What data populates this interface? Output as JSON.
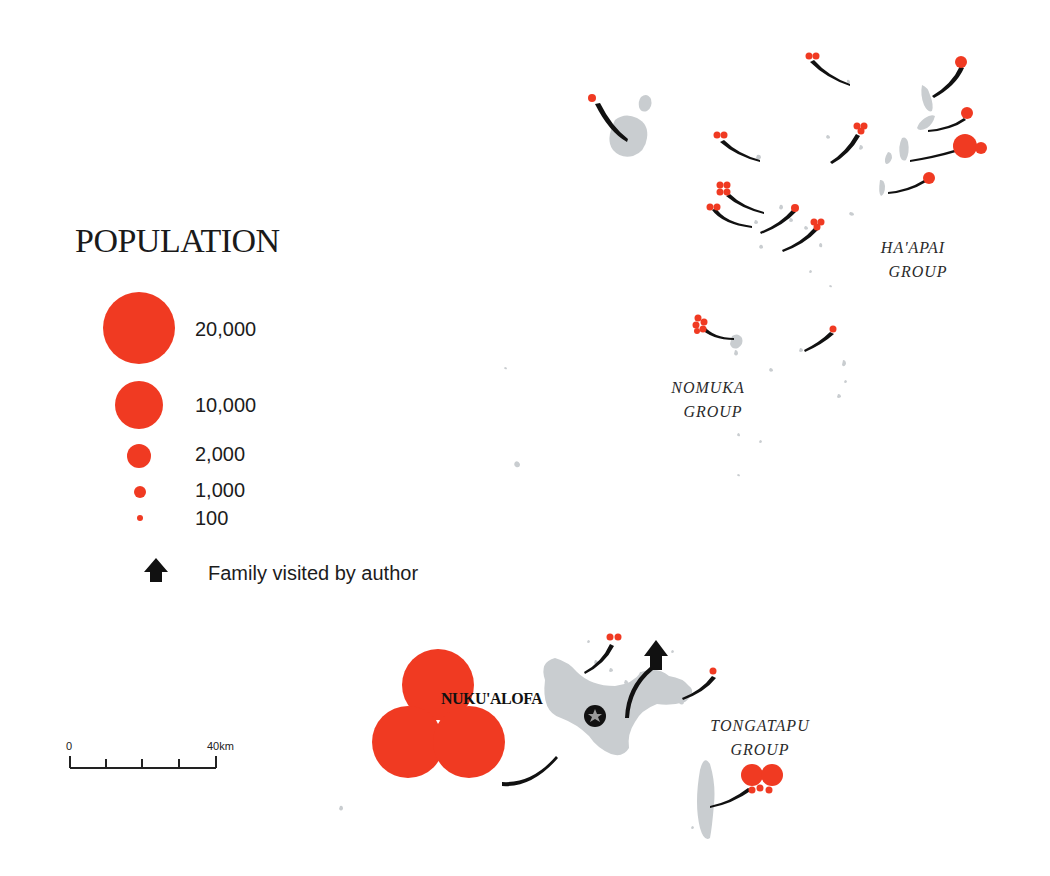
{
  "legend": {
    "title": "POPULATION",
    "items": [
      {
        "label": "20,000",
        "radius": 36
      },
      {
        "label": "10,000",
        "radius": 24
      },
      {
        "label": "2,000",
        "radius": 12
      },
      {
        "label": "1,000",
        "radius": 6
      },
      {
        "label": "100",
        "radius": 3
      }
    ],
    "arrow_label": "Family visited by author"
  },
  "scale_bar": {
    "start_label": "0",
    "end_label": "40km"
  },
  "place_labels": {
    "haapai_line1": "HA'APAI",
    "haapai_line2": "GROUP",
    "nomuka_line1": "NOMUKA",
    "nomuka_line2": "GROUP",
    "tongatapu_line1": "TONGATAPU",
    "tongatapu_line2": "GROUP",
    "capital": "NUKU'ALOFA"
  },
  "colors": {
    "population_dot": "#f03a22",
    "land": "#c9cdd0",
    "flow_line": "#111111",
    "background": "#ffffff"
  }
}
